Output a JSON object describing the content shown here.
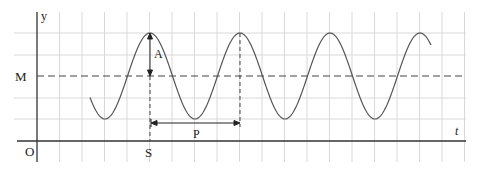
{
  "diagram": {
    "type": "sinusoidal-wave",
    "labels": {
      "y_axis": "y",
      "t_axis": "t",
      "origin": "O",
      "midline": "M",
      "amplitude": "A",
      "period": "P",
      "start": "S"
    },
    "colors": {
      "grid": "#d9d9d9",
      "axis": "#333333",
      "curve": "#555555",
      "dashed": "#444444",
      "text": "#222222"
    },
    "geometry": {
      "axis_x": 37,
      "t_axis_y": 141,
      "midline_y": 76,
      "amplitude_px": 43,
      "period_px": 90,
      "first_peak_x": 150,
      "curve_start_x": 90,
      "curve_end_x": 431,
      "grid_spacing_x": 22.5,
      "grid_rows_y": [
        33,
        55,
        76,
        98,
        119
      ]
    }
  }
}
